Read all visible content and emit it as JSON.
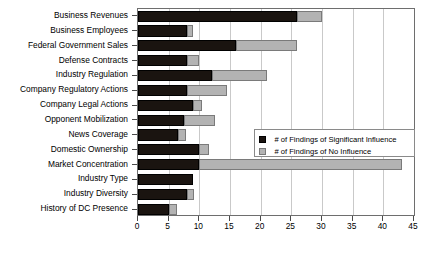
{
  "chart_data": {
    "type": "bar",
    "orientation": "horizontal",
    "stacked": false,
    "grouped": false,
    "title": "",
    "xlabel": "",
    "ylabel": "",
    "xlim": [
      0,
      45
    ],
    "xticks": [
      0,
      5,
      10,
      15,
      20,
      25,
      30,
      35,
      40,
      45
    ],
    "grid": "vertical",
    "legend_position": "middle-right-inside",
    "categories": [
      "Business Revenues",
      "Business Employees",
      "Federal Government Sales",
      "Defense Contracts",
      "Industry Regulation",
      "Company Regulatory Actions",
      "Company Legal Actions",
      "Opponent Mobilization",
      "News Coverage",
      "Domestic Ownership",
      "Market Concentration",
      "Industry Type",
      "Industry Diversity",
      "History of DC Presence"
    ],
    "series": [
      {
        "name": "# of Findings of Significant Influence",
        "color": "#1a1410",
        "values": [
          26,
          8,
          16,
          8,
          12,
          8,
          9,
          7.5,
          6.5,
          10,
          10,
          9,
          8,
          5
        ]
      },
      {
        "name": "# of Findings of No Influence",
        "color": "#b3b3b3",
        "values": [
          30,
          9,
          26,
          10,
          21,
          14.5,
          10.5,
          12.5,
          7.8,
          11.5,
          43,
          9,
          9.2,
          6.3
        ]
      }
    ]
  },
  "legend": {
    "entries": [
      {
        "label": "# of Findings of Significant Influence",
        "swatch": "black-square-icon"
      },
      {
        "label": "# of Findings of No Influence",
        "swatch": "gray-square-icon"
      }
    ]
  }
}
